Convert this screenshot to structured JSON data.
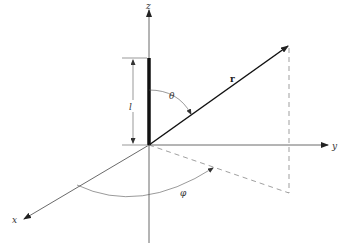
{
  "diagram": {
    "title": "",
    "type": "spherical-coordinate-system",
    "colors": {
      "line": "#222222",
      "thin": "#555555",
      "dashed": "#666666",
      "background": "#ffffff"
    },
    "labels": {
      "z_axis": "z",
      "y_axis": "y",
      "x_axis": "x",
      "radius": "r",
      "theta": "θ",
      "phi": "φ",
      "length": "l"
    },
    "nodes": [
      {
        "id": "origin",
        "x": 149,
        "y": 145
      },
      {
        "id": "r_tip",
        "x": 288,
        "y": 46
      },
      {
        "id": "projection",
        "x": 289,
        "y": 193
      }
    ],
    "edges": [
      {
        "from": "origin",
        "to": "z_top",
        "kind": "axis"
      },
      {
        "from": "origin",
        "to": "y_end",
        "kind": "axis"
      },
      {
        "from": "origin",
        "to": "x_end",
        "kind": "axis"
      },
      {
        "from": "origin",
        "to": "r_tip",
        "kind": "vector"
      },
      {
        "from": "r_tip",
        "to": "projection",
        "kind": "dashed"
      },
      {
        "from": "origin",
        "to": "projection",
        "kind": "dashed"
      }
    ]
  }
}
